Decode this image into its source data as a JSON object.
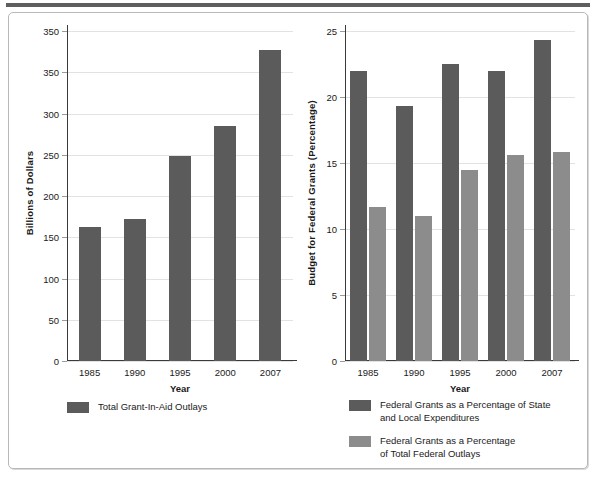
{
  "chart_data": [
    {
      "type": "bar",
      "id": "total-grant-in-aid-outlays",
      "title": "",
      "xlabel": "Year",
      "ylabel": "Billions of Dollars",
      "categories": [
        "1985",
        "1990",
        "1995",
        "2000",
        "2007"
      ],
      "values": [
        162,
        172,
        248,
        285,
        377
      ],
      "yticks": [
        "0",
        "50",
        "100",
        "150",
        "200",
        "250",
        "300",
        "350",
        "350"
      ],
      "ytick_values": [
        0,
        50,
        100,
        150,
        200,
        250,
        300,
        350,
        400
      ],
      "ylim": [
        0,
        400
      ],
      "grid": true,
      "legend_position": "bottom-left",
      "series": [
        {
          "name": "Total Grant-In-Aid Outlays",
          "color": "#5b5b5b",
          "values": [
            162,
            172,
            248,
            285,
            377
          ]
        }
      ]
    },
    {
      "type": "bar",
      "id": "federal-grants-percentage",
      "title": "",
      "xlabel": "Year",
      "ylabel": "Budget for Federal Grants (Percentage)",
      "categories": [
        "1985",
        "1990",
        "1995",
        "2000",
        "2007"
      ],
      "yticks": [
        "0",
        "5",
        "10",
        "15",
        "20",
        "25"
      ],
      "ytick_values": [
        0,
        5,
        10,
        15,
        20,
        25
      ],
      "ylim": [
        0,
        25
      ],
      "grid": true,
      "legend_position": "bottom-right",
      "series": [
        {
          "name": "Federal Grants as a Percentage of State and Local Expenditures",
          "color": "#5b5b5b",
          "values": [
            22.0,
            19.3,
            22.5,
            22.0,
            24.3
          ]
        },
        {
          "name": "Federal Grants as a Percentage of Total Federal Outlays",
          "color": "#8c8c8c",
          "values": [
            11.7,
            11.0,
            14.5,
            15.6,
            15.8
          ]
        }
      ]
    }
  ],
  "left_chart": {
    "ylabel": "Billions of Dollars",
    "xlabel": "Year",
    "yticks": [
      "350",
      "350",
      "300",
      "250",
      "200",
      "150",
      "100",
      "50",
      "0"
    ],
    "xlabels": [
      "1985",
      "1990",
      "1995",
      "2000",
      "2007"
    ],
    "legend": [
      {
        "label": "Total Grant-In-Aid Outlays",
        "line2": "",
        "color": "#5b5b5b"
      }
    ]
  },
  "right_chart": {
    "ylabel": "Budget for Federal Grants (Percentage)",
    "xlabel": "Year",
    "yticks": [
      "25",
      "20",
      "15",
      "10",
      "5",
      "0"
    ],
    "xlabels": [
      "1985",
      "1990",
      "1995",
      "2000",
      "2007"
    ],
    "legend": [
      {
        "label": "Federal Grants as a Percentage of State",
        "line2": "and Local Expenditures",
        "color": "#5b5b5b"
      },
      {
        "label": "Federal Grants as a Percentage",
        "line2": "of Total Federal Outlays",
        "color": "#8c8c8c"
      }
    ]
  },
  "colors": {
    "dark_bar": "#5b5b5b",
    "light_bar": "#8c8c8c",
    "axis": "#3a3a3a",
    "grid": "#e2e2e2",
    "panel_border": "#b9b9b9",
    "top_rule": "#5e5e5e"
  }
}
